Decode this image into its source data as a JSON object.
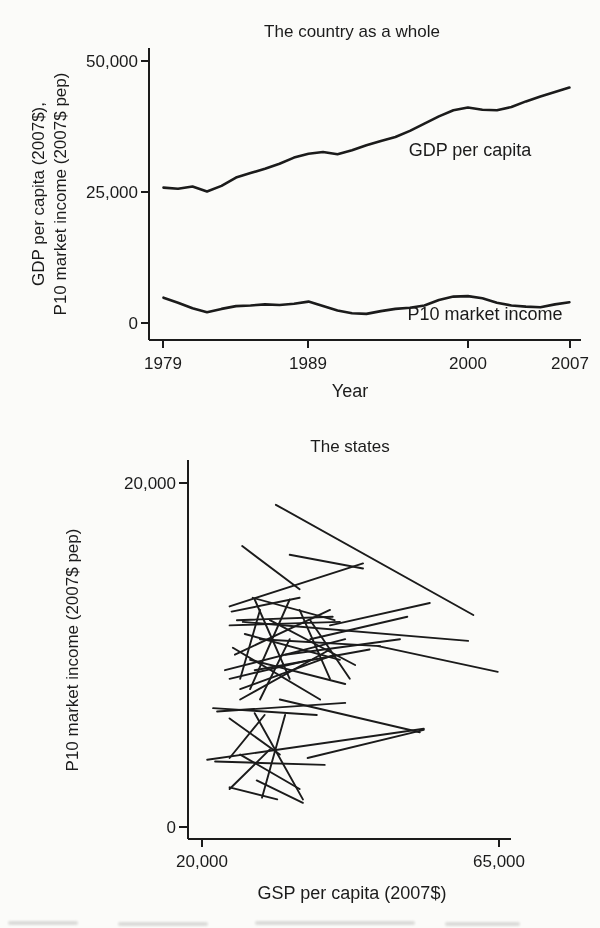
{
  "page": {
    "background_color": "#fbfbf9",
    "ink_color": "#1b1b1b"
  },
  "chart_data": [
    {
      "type": "line",
      "title": "The country as a whole",
      "xlabel": "Year",
      "ylabel_lines": [
        "GDP per capita (2007$),",
        "P10 market income (2007$ pep)"
      ],
      "x": [
        1979,
        1980,
        1981,
        1982,
        1983,
        1984,
        1985,
        1986,
        1987,
        1988,
        1989,
        1990,
        1991,
        1992,
        1993,
        1994,
        1995,
        1996,
        1997,
        1998,
        1999,
        2000,
        2001,
        2002,
        2003,
        2004,
        2005,
        2006,
        2007
      ],
      "series": [
        {
          "name": "GDP per capita",
          "values": [
            27400,
            27200,
            27600,
            26700,
            27700,
            29200,
            30000,
            30800,
            31700,
            32800,
            33500,
            33800,
            33400,
            34100,
            35000,
            35800,
            36500,
            37600,
            38900,
            40200,
            41300,
            41800,
            41400,
            41300,
            41900,
            42900,
            43800,
            44600,
            45400
          ]
        },
        {
          "name": "P10 market income",
          "values": [
            7600,
            6700,
            5700,
            5000,
            5600,
            6100,
            6200,
            6400,
            6300,
            6500,
            6900,
            6100,
            5300,
            4800,
            4700,
            5200,
            5600,
            5800,
            6200,
            7200,
            7800,
            7900,
            7500,
            6700,
            6200,
            6000,
            5900,
            6400,
            6800
          ]
        }
      ],
      "xlim": [
        1978,
        2007.8
      ],
      "ylim": [
        0,
        52500
      ],
      "xticks": [
        {
          "v": 1979,
          "label": "1979"
        },
        {
          "v": 1989,
          "label": "1989"
        },
        {
          "v": 2000,
          "label": "2000"
        },
        {
          "v": 2007,
          "label": "2007"
        }
      ],
      "yticks": [
        {
          "v": 0,
          "label": "0"
        },
        {
          "v": 25000,
          "label": "25,000"
        },
        {
          "v": 50000,
          "label": "50,000"
        }
      ],
      "grid": false,
      "legend": "inline annotations next to lines"
    },
    {
      "type": "line-segments",
      "title": "The states",
      "xlabel": "GSP per capita (2007$)",
      "ylabel": "P10 market income (2007$ pep)",
      "xlim": [
        17900,
        66800
      ],
      "ylim": [
        -700,
        21300
      ],
      "xticks": [
        {
          "v": 20000,
          "label": "20,000"
        },
        {
          "v": 65000,
          "label": "65,000"
        }
      ],
      "yticks": [
        {
          "v": 0,
          "label": "0"
        },
        {
          "v": 20000,
          "label": "20,000"
        }
      ],
      "grid": false,
      "segments_note": "one trend segment per state; endpoints [x1,y1,x2,y2] in 2007$ (GSP per capita, P10 market income)",
      "segments": [
        [
          31200,
          18700,
          61100,
          12300
        ],
        [
          26100,
          16300,
          34800,
          13800
        ],
        [
          24200,
          12800,
          44400,
          15300
        ],
        [
          33300,
          15800,
          44400,
          15000
        ],
        [
          25300,
          12000,
          39800,
          12200
        ],
        [
          24200,
          11700,
          40900,
          11900
        ],
        [
          26200,
          11900,
          60300,
          10800
        ],
        [
          28000,
          13200,
          33300,
          8600
        ],
        [
          27300,
          8000,
          33300,
          13200
        ],
        [
          25000,
          10000,
          39400,
          12600
        ],
        [
          23500,
          9100,
          41700,
          10900
        ],
        [
          25800,
          8000,
          40100,
          10000
        ],
        [
          28800,
          10900,
          47000,
          10500
        ],
        [
          46700,
          10500,
          64800,
          9000
        ],
        [
          36400,
          10900,
          51100,
          12200
        ],
        [
          39400,
          11700,
          54500,
          13000
        ],
        [
          20800,
          3900,
          53600,
          5700
        ],
        [
          36000,
          4000,
          53600,
          5640
        ],
        [
          31800,
          7400,
          53000,
          5500
        ],
        [
          22300,
          6700,
          41700,
          7200
        ],
        [
          21700,
          6900,
          37400,
          6500
        ],
        [
          28000,
          6600,
          35300,
          1600
        ],
        [
          29100,
          1700,
          32600,
          6500
        ],
        [
          24200,
          6300,
          31800,
          4200
        ],
        [
          24200,
          4000,
          29500,
          6500
        ],
        [
          22000,
          3800,
          38600,
          3600
        ],
        [
          24200,
          2300,
          31400,
          1600
        ],
        [
          28300,
          2700,
          35300,
          1400
        ],
        [
          24200,
          2200,
          30300,
          4500
        ],
        [
          25800,
          4200,
          34800,
          2200
        ],
        [
          24700,
          10400,
          37900,
          7400
        ],
        [
          25800,
          7400,
          39400,
          10300
        ],
        [
          27300,
          9700,
          41700,
          8300
        ],
        [
          24200,
          8600,
          36400,
          9700
        ],
        [
          25800,
          8600,
          28800,
          12600
        ],
        [
          34800,
          12600,
          39400,
          8600
        ],
        [
          30300,
          12000,
          43200,
          9400
        ],
        [
          32600,
          10000,
          50000,
          10900
        ],
        [
          26500,
          11200,
          40900,
          9700
        ],
        [
          28000,
          9100,
          45400,
          10300
        ],
        [
          28800,
          7400,
          33300,
          10900
        ],
        [
          36400,
          12000,
          42400,
          8600
        ],
        [
          27700,
          13300,
          40100,
          12000
        ],
        [
          24500,
          12500,
          34800,
          13300
        ]
      ]
    }
  ]
}
